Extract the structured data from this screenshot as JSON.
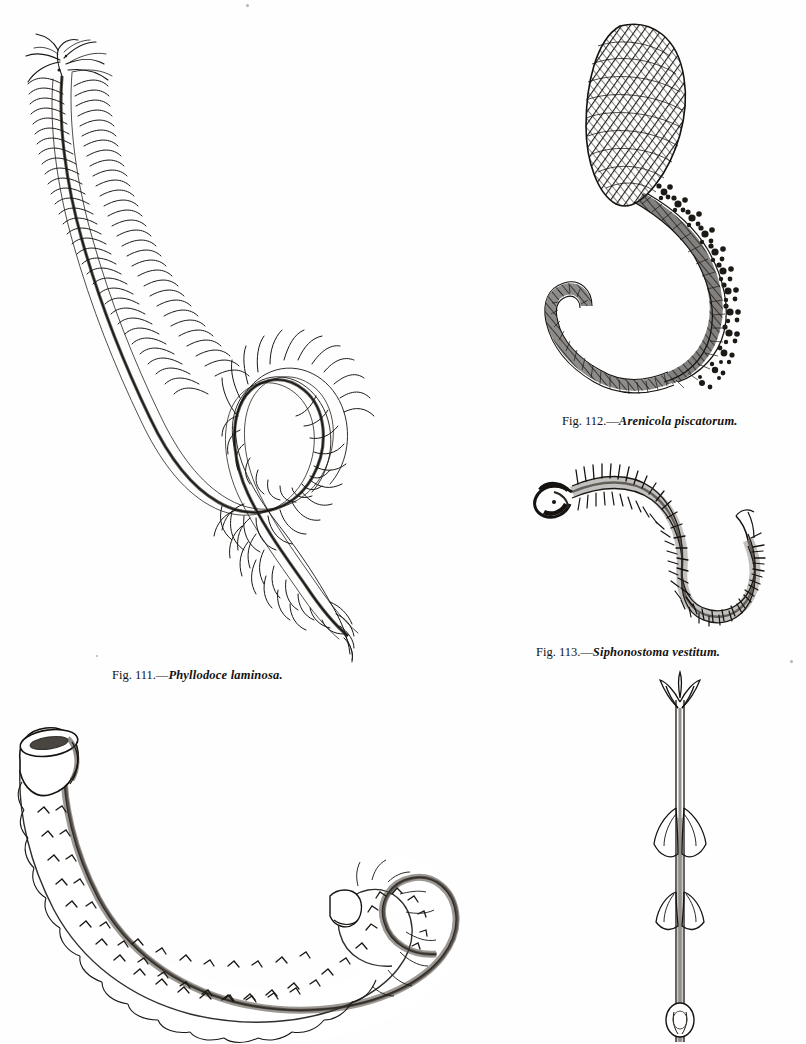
{
  "plate": {
    "medium": "engraving",
    "background_color": "#fefefe",
    "ink_color": "#14110e",
    "subject": "marine annelid worms"
  },
  "figures": [
    {
      "id": "fig-111",
      "number": "111",
      "caption_lead": "Fig. 111.—",
      "species": "Phyllodoce laminosa.",
      "caption_full": "Fig. 111.—Phyllodoce laminosa.",
      "description": "elongate serpentine polychaete with paired leaf-like parapodia along entire body, coiled into an S-shaped double loop",
      "position": "upper-left"
    },
    {
      "id": "fig-112",
      "number": "112",
      "caption_lead": "Fig. 112.—",
      "species": "Arenicola piscatorum.",
      "caption_full": "Fig. 112.—Arenicola piscatorum.",
      "description": "lugworm with swollen cross-hatched anterior, bushy branched gill tufts along mid-body, and annulated tapering tail",
      "position": "upper-right"
    },
    {
      "id": "fig-113",
      "number": "113",
      "caption_lead": "Fig. 113.—",
      "species": "Siphonostoma vestitum.",
      "caption_full": "Fig. 113.—Siphonostoma vestitum.",
      "description": "slender S-curved worm with dense comb-like chaetae on both margins and a crescent-shaped anterior",
      "position": "middle-right"
    },
    {
      "id": "fig-tube",
      "number": "",
      "caption_lead": "",
      "species": "",
      "caption_full": "",
      "description": "curved worm tube with flared funnel opening, scalloped margins, chevron surface markings, and a hooked terminal coil",
      "position": "lower-left"
    },
    {
      "id": "fig-stalk",
      "number": "",
      "caption_lead": "",
      "species": "",
      "caption_full": "",
      "description": "slender vertical stalk bearing pointed leaf-like sheaths at intervals with a rounded basal node",
      "position": "lower-right"
    }
  ]
}
